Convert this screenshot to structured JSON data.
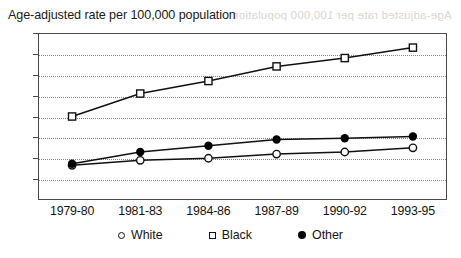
{
  "chart_data": {
    "type": "line",
    "title": "Age-adjusted rate per 100,000 population",
    "xlabel": "",
    "ylabel": "",
    "categories": [
      "1979-80",
      "1981-83",
      "1984-86",
      "1987-89",
      "1990-92",
      "1993-95"
    ],
    "ylim": [
      0,
      4.0
    ],
    "yticks": [
      "0",
      "0.5",
      "1.0",
      "1.5",
      "2.0",
      "2.5",
      "3.0",
      "3.5",
      "4.0"
    ],
    "ytick_values": [
      0,
      0.5,
      1.0,
      1.5,
      2.0,
      2.5,
      3.0,
      3.5,
      4.0
    ],
    "grid": true,
    "grid_style": "dotted-horizontal",
    "legend_position": "bottom-center",
    "series": [
      {
        "name": "White",
        "marker": "open-circle",
        "values": [
          0.83,
          0.95,
          1.0,
          1.1,
          1.15,
          1.25
        ]
      },
      {
        "name": "Black",
        "marker": "open-square",
        "values": [
          2.0,
          2.55,
          2.85,
          3.2,
          3.4,
          3.65
        ]
      },
      {
        "name": "Other",
        "marker": "filled-circle",
        "values": [
          0.87,
          1.15,
          1.3,
          1.45,
          1.48,
          1.52
        ]
      }
    ]
  },
  "artifacts": {
    "bleed_through_text": "Age-adjusted rate per 100,000 population"
  },
  "colors": {
    "line": "#111111",
    "frame": "#4a4a4a",
    "grid": "#8a8a8a",
    "text": "#151515",
    "background": "#ffffff"
  }
}
